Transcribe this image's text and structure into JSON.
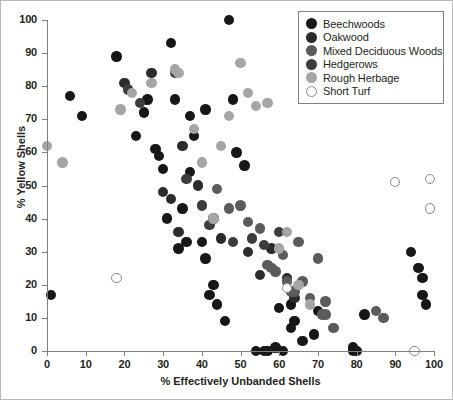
{
  "chart_data": {
    "type": "scatter",
    "title": "",
    "xlabel": "% Effectively Unbanded Shells",
    "ylabel": "% Yellow Shells",
    "xlim": [
      0,
      100
    ],
    "ylim": [
      0,
      100
    ],
    "xticks": [
      0,
      10,
      20,
      30,
      40,
      50,
      60,
      70,
      80,
      90,
      100
    ],
    "yticks": [
      0,
      10,
      20,
      30,
      40,
      50,
      60,
      70,
      80,
      90,
      100
    ],
    "grid": false,
    "legend_position": "top-right",
    "series": [
      {
        "name": "Beechwoods",
        "color": "#171717",
        "marker": "filled-circle",
        "points": [
          [
            1,
            17
          ],
          [
            6,
            77
          ],
          [
            9,
            71
          ],
          [
            18,
            89
          ],
          [
            23,
            65
          ],
          [
            25,
            72
          ],
          [
            26,
            76
          ],
          [
            28,
            61
          ],
          [
            29,
            59
          ],
          [
            30,
            55
          ],
          [
            31,
            40
          ],
          [
            32,
            93
          ],
          [
            33,
            76
          ],
          [
            34,
            31
          ],
          [
            35,
            43
          ],
          [
            36,
            33
          ],
          [
            37,
            71
          ],
          [
            37,
            54
          ],
          [
            38,
            65
          ],
          [
            40,
            33
          ],
          [
            41,
            28
          ],
          [
            41,
            73
          ],
          [
            42,
            17
          ],
          [
            43,
            20
          ],
          [
            44,
            14
          ],
          [
            46,
            9
          ],
          [
            47,
            100
          ],
          [
            48,
            76
          ],
          [
            49,
            60
          ],
          [
            51,
            56
          ],
          [
            54,
            0
          ],
          [
            56,
            0
          ],
          [
            57,
            0
          ],
          [
            59,
            1
          ],
          [
            60,
            13
          ],
          [
            61,
            0
          ],
          [
            63,
            14
          ],
          [
            63,
            7
          ],
          [
            64,
            9
          ],
          [
            66,
            3
          ],
          [
            69,
            5
          ],
          [
            70,
            12
          ],
          [
            79,
            0
          ],
          [
            79,
            1
          ],
          [
            80,
            0
          ],
          [
            82,
            11
          ],
          [
            94,
            30
          ],
          [
            96,
            25
          ],
          [
            97,
            22
          ],
          [
            97,
            17
          ],
          [
            98,
            14
          ]
        ]
      },
      {
        "name": "Oakwood",
        "color": "#2b2b2b",
        "marker": "filled-circle",
        "points": [
          [
            20,
            81
          ],
          [
            27,
            84
          ],
          [
            30,
            48
          ],
          [
            32,
            46
          ],
          [
            34,
            36
          ],
          [
            35,
            62
          ],
          [
            39,
            50
          ],
          [
            43,
            40
          ],
          [
            45,
            34
          ],
          [
            52,
            30
          ],
          [
            55,
            23
          ],
          [
            58,
            31
          ],
          [
            62,
            22
          ],
          [
            64,
            16
          ]
        ]
      },
      {
        "name": "Mixed Deciduous Woods",
        "color": "#5b5b5b",
        "marker": "filled-circle",
        "points": [
          [
            44,
            49
          ],
          [
            47,
            43
          ],
          [
            50,
            44
          ],
          [
            52,
            39
          ],
          [
            55,
            37
          ],
          [
            57,
            26
          ],
          [
            58,
            25
          ],
          [
            59,
            24
          ],
          [
            61,
            29
          ],
          [
            62,
            21
          ],
          [
            63,
            18
          ],
          [
            64,
            18
          ],
          [
            65,
            33
          ],
          [
            66,
            21
          ],
          [
            68,
            16
          ],
          [
            70,
            28
          ],
          [
            71,
            11
          ],
          [
            72,
            11
          ],
          [
            72,
            15
          ],
          [
            74,
            7
          ],
          [
            85,
            12
          ],
          [
            87,
            10
          ]
        ]
      },
      {
        "name": "Hedgerows",
        "color": "#3c3c3c",
        "marker": "filled-circle",
        "points": [
          [
            21,
            79
          ],
          [
            24,
            75
          ],
          [
            33,
            84
          ],
          [
            36,
            52
          ],
          [
            40,
            44
          ],
          [
            42,
            38
          ],
          [
            48,
            33
          ],
          [
            53,
            34
          ],
          [
            56,
            32
          ],
          [
            60,
            36
          ]
        ]
      },
      {
        "name": "Rough Herbage",
        "color": "#a5a5a5",
        "marker": "filled-circle",
        "points": [
          [
            0,
            62
          ],
          [
            4,
            57
          ],
          [
            19,
            73
          ],
          [
            22,
            78
          ],
          [
            27,
            81
          ],
          [
            33,
            85
          ],
          [
            34,
            84
          ],
          [
            38,
            67
          ],
          [
            40,
            57
          ],
          [
            43,
            40
          ],
          [
            45,
            62
          ],
          [
            47,
            71
          ],
          [
            50,
            87
          ],
          [
            52,
            78
          ],
          [
            54,
            74
          ],
          [
            57,
            75
          ],
          [
            60,
            31
          ],
          [
            62,
            36
          ],
          [
            65,
            20
          ],
          [
            68,
            14
          ]
        ]
      },
      {
        "name": "Short Turf",
        "color": "#ffffff",
        "marker": "open-circle",
        "points": [
          [
            18,
            22
          ],
          [
            62,
            19
          ],
          [
            90,
            51
          ],
          [
            95,
            0
          ],
          [
            99,
            52
          ],
          [
            99,
            43
          ]
        ]
      }
    ]
  },
  "legend": {
    "items": [
      {
        "label": "Beechwoods",
        "color": "#171717",
        "open": false
      },
      {
        "label": "Oakwood",
        "color": "#2b2b2b",
        "open": false
      },
      {
        "label": "Mixed Deciduous Woods",
        "color": "#5b5b5b",
        "open": false
      },
      {
        "label": "Hedgerows",
        "color": "#3c3c3c",
        "open": false
      },
      {
        "label": "Rough Herbage",
        "color": "#a5a5a5",
        "open": false
      },
      {
        "label": "Short Turf",
        "color": "#ffffff",
        "open": true
      }
    ]
  }
}
